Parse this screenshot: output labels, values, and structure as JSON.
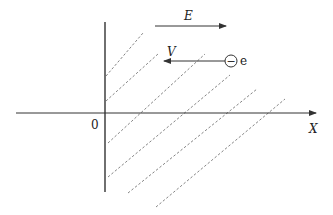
{
  "diagram": {
    "field_label": "E",
    "velocity_label": "V",
    "charge_symbol": "−",
    "particle_label": "e",
    "origin_label": "0",
    "x_axis_label": "X",
    "colors": {
      "stroke": "#333333",
      "dashed": "#666666",
      "background": "#ffffff"
    }
  }
}
